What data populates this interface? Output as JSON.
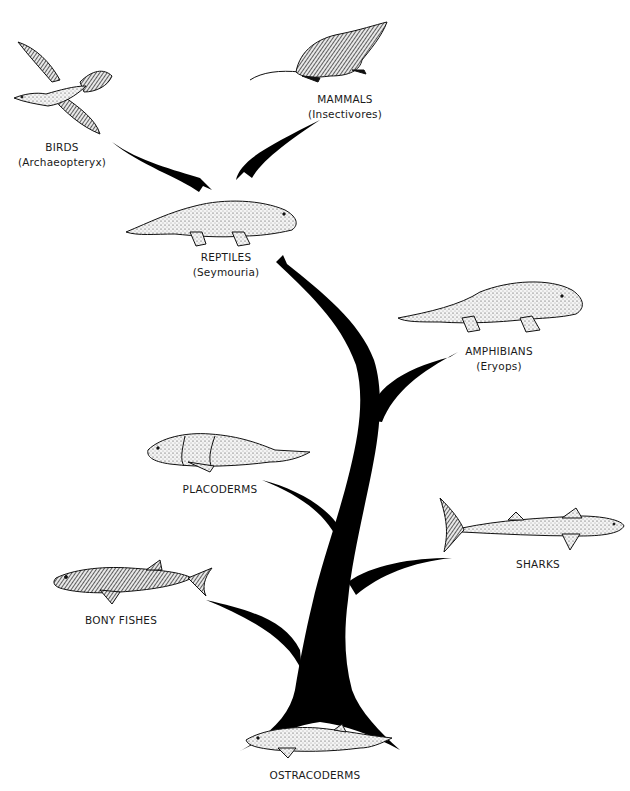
{
  "diagram": {
    "type": "evolutionary-tree",
    "colors": {
      "branch": "#000000",
      "background": "#ffffff",
      "drawing_fill": "#f2f2f2",
      "drawing_ink": "#111111"
    },
    "groups": [
      {
        "id": "birds",
        "name": "BIRDS",
        "example": "(Archaeopteryx)"
      },
      {
        "id": "mammals",
        "name": "MAMMALS",
        "example": "(Insectivores)"
      },
      {
        "id": "reptiles",
        "name": "REPTILES",
        "example": "(Seymouria)"
      },
      {
        "id": "amphibians",
        "name": "AMPHIBIANS",
        "example": "(Eryops)"
      },
      {
        "id": "placoderms",
        "name": "PLACODERMS",
        "example": ""
      },
      {
        "id": "sharks",
        "name": "SHARKS",
        "example": ""
      },
      {
        "id": "bony_fishes",
        "name": "BONY FISHES",
        "example": ""
      },
      {
        "id": "ostracoderms",
        "name": "OSTRACODERMS",
        "example": ""
      }
    ],
    "edges": [
      {
        "from": "ostracoderms",
        "to": "bony_fishes"
      },
      {
        "from": "ostracoderms",
        "to": "sharks"
      },
      {
        "from": "ostracoderms",
        "to": "placoderms"
      },
      {
        "from": "ostracoderms",
        "to": "amphibians"
      },
      {
        "from": "amphibians",
        "to": "reptiles"
      },
      {
        "from": "reptiles",
        "to": "birds"
      },
      {
        "from": "reptiles",
        "to": "mammals"
      }
    ]
  }
}
